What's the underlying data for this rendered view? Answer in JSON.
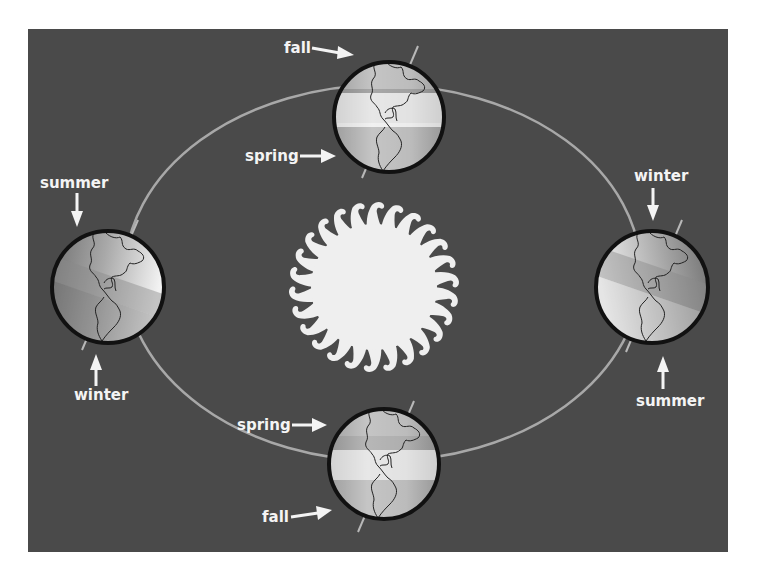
{
  "diagram": {
    "colors": {
      "page_background": "#ffffff",
      "panel_background": "#4a4a4a",
      "orbit_line": "#a8a8a8",
      "sun": "#efefef",
      "label_text": "#f4f4f4",
      "globe_outline": "#111111"
    },
    "sun": {
      "label": "Sun",
      "ray_count": 26
    },
    "orbit": {
      "label": "Earth's orbit"
    },
    "positions": [
      {
        "id": "top",
        "upper_label": "fall",
        "lower_label": "spring",
        "arrow_direction": "right"
      },
      {
        "id": "left",
        "upper_label": "summer",
        "lower_label": "winter",
        "arrow_direction": "vertical"
      },
      {
        "id": "right",
        "upper_label": "winter",
        "lower_label": "summer",
        "arrow_direction": "vertical"
      },
      {
        "id": "bottom",
        "upper_label": "spring",
        "lower_label": "fall",
        "arrow_direction": "right"
      }
    ]
  }
}
